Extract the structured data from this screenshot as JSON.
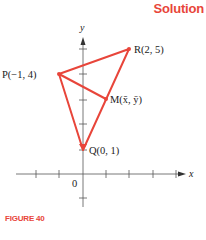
{
  "header": {
    "title": "Solution"
  },
  "caption": {
    "label": "FIGURE 40"
  },
  "axes": {
    "x_label": "x",
    "y_label": "y",
    "origin_label": "0"
  },
  "points": {
    "P": {
      "label": "P(−1, 4)",
      "x": -1,
      "y": 4
    },
    "R": {
      "label": "R(2, 5)",
      "x": 2,
      "y": 5
    },
    "Q": {
      "label": "Q(0, 1)",
      "x": 0,
      "y": 1
    },
    "M": {
      "label": "M(x̄, ȳ)",
      "x": 1,
      "y": 3
    }
  },
  "colors": {
    "accent": "#e8453a",
    "axis": "#555555",
    "text": "#222222"
  }
}
